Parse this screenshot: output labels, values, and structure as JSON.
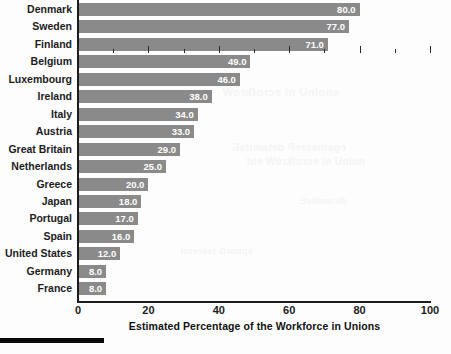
{
  "chart_data": {
    "type": "bar",
    "orientation": "horizontal",
    "title": "",
    "xlabel": "Estimated Percentage of the Workforce in Unions",
    "ylabel": "",
    "xlim": [
      0,
      100
    ],
    "xticks": [
      0,
      20,
      40,
      60,
      80,
      100
    ],
    "xtick_labels": [
      "0",
      "20",
      "40",
      "60",
      "80",
      "100"
    ],
    "minor_xticks": [
      10,
      30,
      50,
      70,
      90
    ],
    "grid": false,
    "legend": null,
    "bar_color": "#8a8a8a",
    "value_label_color": "#ffffff",
    "value_label_format": "one-decimal",
    "categories": [
      "Denmark",
      "Sweden",
      "Finland",
      "Belgium",
      "Luxembourg",
      "Ireland",
      "Italy",
      "Austria",
      "Great Britain",
      "Netherlands",
      "Greece",
      "Japan",
      "Portugal",
      "Spain",
      "United States",
      "Germany",
      "France"
    ],
    "values": [
      80.0,
      77.0,
      71.0,
      49.0,
      46.0,
      38.0,
      34.0,
      33.0,
      29.0,
      25.0,
      20.0,
      18.0,
      17.0,
      16.0,
      12.0,
      8.0,
      8.0
    ],
    "value_labels": [
      "80.0",
      "77.0",
      "71.0",
      "49.0",
      "46.0",
      "38.0",
      "34.0",
      "33.0",
      "29.0",
      "25.0",
      "20.0",
      "18.0",
      "17.0",
      "16.0",
      "12.0",
      "8.0",
      "8.0"
    ]
  },
  "ghost_text": {
    "a": "snoinU ni ecrofkroW",
    "b": "egatnecreP detamitsE",
    "c": "noinU ni ecrofkroW eht",
    "d": "detamitsE",
    "e": "spuorG tseretnI"
  }
}
